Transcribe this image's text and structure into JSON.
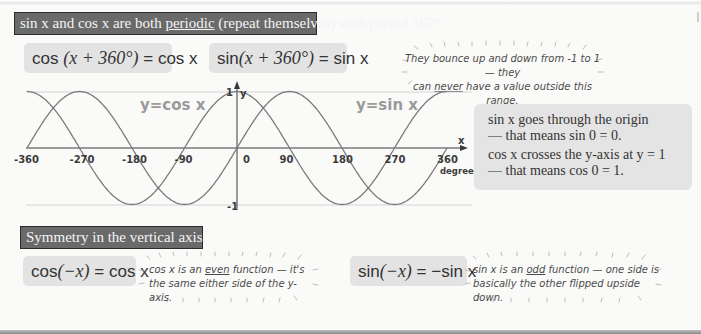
{
  "banners": {
    "periodic": {
      "before": "sin x and cos x are both ",
      "underlined": "periodic",
      "after": " (repeat themselves) with period 360°"
    },
    "symmetry": "Symmetry in the vertical axis:"
  },
  "formulas": {
    "cos_period": {
      "lhs_fn": "cos",
      "lhs_arg": "(x + 360°)",
      "rhs": "= cos x"
    },
    "sin_period": {
      "lhs_fn": "sin",
      "lhs_arg": "(x + 360°)",
      "rhs": "= sin x"
    },
    "cos_even": {
      "lhs_fn": "cos",
      "lhs_arg": "(−x)",
      "rhs": "= cos x"
    },
    "sin_odd": {
      "lhs_fn": "sin",
      "lhs_arg": "(−x)",
      "rhs": "= −sin x"
    }
  },
  "bubbles": {
    "range": {
      "line1": "They bounce up and down from -1 to 1 — they",
      "line2_before": "can ",
      "line2_underlined": "never",
      "line2_after": " have a value outside this range."
    },
    "cos_even": {
      "line1_before": "cos x is  an ",
      "line1_underlined": "even",
      "line1_after": " function — it's",
      "line2": "the same either side of the y-axis."
    },
    "sin_odd": {
      "line1_before": "sin x is an ",
      "line1_underlined": "odd",
      "line1_after": " function — one side is",
      "line2": "basically the other flipped upside down."
    }
  },
  "info_box": {
    "sin_line1": "sin x goes through the origin",
    "sin_line2": "— that means sin 0 = 0.",
    "cos_line1": "cos x crosses the y-axis at y = 1",
    "cos_line2": "— that means cos 0 = 1."
  },
  "chart_data": {
    "type": "line",
    "title": "",
    "xlabel": "x",
    "xunit": "degrees",
    "ylabel": "y",
    "xlim": [
      -360,
      360
    ],
    "ylim": [
      -1,
      1
    ],
    "x_ticks": [
      "-360",
      "-270",
      "-180",
      "-90",
      "0",
      "90",
      "180",
      "270",
      "360"
    ],
    "y_ticks": [
      "1",
      "-1"
    ],
    "grid": false,
    "reference_lines": [
      1,
      -1
    ],
    "series": [
      {
        "name": "y=cos x",
        "x": [
          -360,
          -270,
          -180,
          -90,
          0,
          90,
          180,
          270,
          360
        ],
        "values": [
          1,
          0,
          -1,
          0,
          1,
          0,
          -1,
          0,
          1
        ]
      },
      {
        "name": "y=sin x",
        "x": [
          -360,
          -270,
          -180,
          -90,
          0,
          90,
          180,
          270,
          360
        ],
        "values": [
          0,
          1,
          0,
          -1,
          0,
          1,
          0,
          -1,
          0
        ]
      }
    ],
    "curve_labels": [
      "y=cos x",
      "y=sin x"
    ],
    "colors": {
      "curves": "#7a7a7a",
      "axes": "#3a3a3a",
      "reference": "#cfcfcf",
      "labels": "#9a9a9a"
    }
  }
}
